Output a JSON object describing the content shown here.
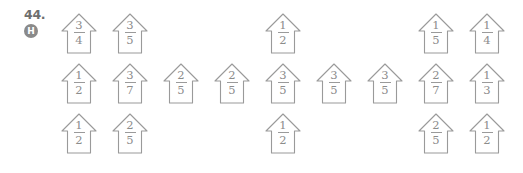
{
  "problem": {
    "number": "44.",
    "difficulty_badge": "H",
    "badge_color": "#8a8a8a"
  },
  "style": {
    "outline_color": "#9a9a9a",
    "text_color": "#8c8c8c",
    "background": "#ffffff"
  },
  "grid": {
    "columns": 9,
    "rows": 3,
    "column_step_px": 51,
    "row_step_px": 50
  },
  "chart_data": {
    "type": "table",
    "title": "",
    "xlabel": "",
    "ylabel": "",
    "shape": "house-pentagon",
    "categories": [
      "col1",
      "col2",
      "col3",
      "col4",
      "col5",
      "col6",
      "col7",
      "col8",
      "col9"
    ],
    "rows": [
      {
        "row": 1,
        "cells": [
          {
            "col": 1,
            "numerator": "3",
            "denominator": "4",
            "value": "3/4"
          },
          {
            "col": 2,
            "numerator": "3",
            "denominator": "5",
            "value": "3/5"
          },
          {
            "col": 3,
            "numerator": "",
            "denominator": "",
            "value": ""
          },
          {
            "col": 4,
            "numerator": "",
            "denominator": "",
            "value": ""
          },
          {
            "col": 5,
            "numerator": "1",
            "denominator": "2",
            "value": "1/2"
          },
          {
            "col": 6,
            "numerator": "",
            "denominator": "",
            "value": ""
          },
          {
            "col": 7,
            "numerator": "",
            "denominator": "",
            "value": ""
          },
          {
            "col": 8,
            "numerator": "1",
            "denominator": "5",
            "value": "1/5"
          },
          {
            "col": 9,
            "numerator": "1",
            "denominator": "4",
            "value": "1/4"
          }
        ]
      },
      {
        "row": 2,
        "cells": [
          {
            "col": 1,
            "numerator": "1",
            "denominator": "2",
            "value": "1/2"
          },
          {
            "col": 2,
            "numerator": "3",
            "denominator": "7",
            "value": "3/7"
          },
          {
            "col": 3,
            "numerator": "2",
            "denominator": "5",
            "value": "2/5"
          },
          {
            "col": 4,
            "numerator": "2",
            "denominator": "5",
            "value": "2/5"
          },
          {
            "col": 5,
            "numerator": "3",
            "denominator": "5",
            "value": "3/5"
          },
          {
            "col": 6,
            "numerator": "3",
            "denominator": "5",
            "value": "3/5"
          },
          {
            "col": 7,
            "numerator": "3",
            "denominator": "5",
            "value": "3/5"
          },
          {
            "col": 8,
            "numerator": "2",
            "denominator": "7",
            "value": "2/7"
          },
          {
            "col": 9,
            "numerator": "1",
            "denominator": "3",
            "value": "1/3"
          }
        ]
      },
      {
        "row": 3,
        "cells": [
          {
            "col": 1,
            "numerator": "1",
            "denominator": "2",
            "value": "1/2"
          },
          {
            "col": 2,
            "numerator": "2",
            "denominator": "5",
            "value": "2/5"
          },
          {
            "col": 3,
            "numerator": "",
            "denominator": "",
            "value": ""
          },
          {
            "col": 4,
            "numerator": "",
            "denominator": "",
            "value": ""
          },
          {
            "col": 5,
            "numerator": "1",
            "denominator": "2",
            "value": "1/2"
          },
          {
            "col": 6,
            "numerator": "",
            "denominator": "",
            "value": ""
          },
          {
            "col": 7,
            "numerator": "",
            "denominator": "",
            "value": ""
          },
          {
            "col": 8,
            "numerator": "2",
            "denominator": "5",
            "value": "2/5"
          },
          {
            "col": 9,
            "numerator": "1",
            "denominator": "2",
            "value": "1/2"
          }
        ]
      }
    ]
  }
}
